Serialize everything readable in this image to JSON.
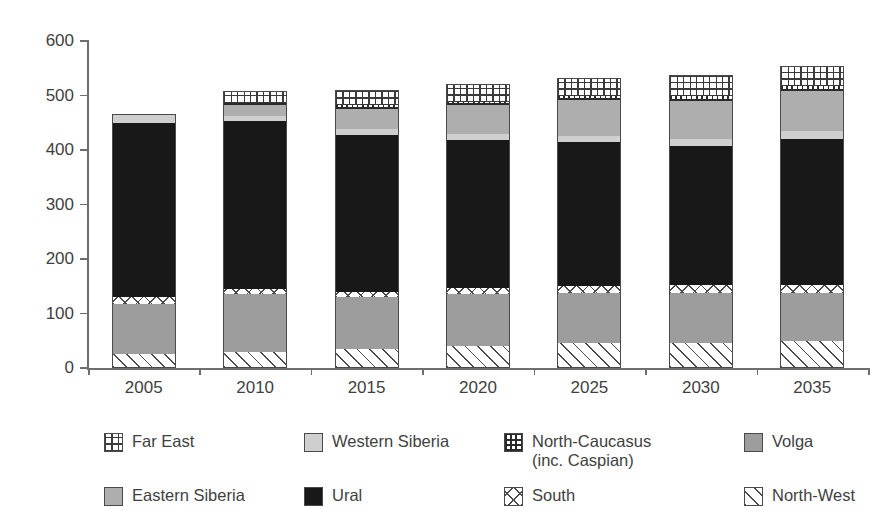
{
  "chart_data": {
    "type": "bar",
    "stacked": true,
    "title": "",
    "subtitle": "",
    "xlabel": "",
    "ylabel": "",
    "ylim": [
      0,
      600
    ],
    "ytick_values": [
      0,
      100,
      200,
      300,
      400,
      500,
      600
    ],
    "ytick_labels": [
      "0",
      "100",
      "200",
      "300",
      "400",
      "500",
      "600"
    ],
    "grid": false,
    "legend_position": "bottom",
    "categories": [
      "2005",
      "2010",
      "2015",
      "2020",
      "2025",
      "2030",
      "2035"
    ],
    "series": [
      {
        "name": "North-West",
        "key": "north-west",
        "pattern": "diagonal-hatch",
        "color": "#ffffff",
        "values": [
          25,
          30,
          35,
          40,
          45,
          46,
          50
        ]
      },
      {
        "name": "Volga",
        "key": "volga",
        "pattern": "solid",
        "color": "#9d9d9d",
        "values": [
          93,
          105,
          95,
          95,
          92,
          92,
          88
        ]
      },
      {
        "name": "South",
        "key": "south",
        "pattern": "cross-hatch",
        "color": "#ffffff",
        "values": [
          12,
          10,
          10,
          12,
          14,
          14,
          15
        ]
      },
      {
        "name": "Ural",
        "key": "ural",
        "pattern": "solid",
        "color": "#181818",
        "values": [
          320,
          308,
          288,
          272,
          263,
          256,
          268
        ]
      },
      {
        "name": "Western Siberia",
        "key": "western-siberia",
        "pattern": "solid",
        "color": "#cfcfcf",
        "values": [
          14,
          10,
          10,
          11,
          12,
          12,
          13
        ]
      },
      {
        "name": "Eastern Siberia",
        "key": "eastern-siberia",
        "pattern": "solid",
        "color": "#aeaeae",
        "values": [
          0,
          20,
          38,
          52,
          65,
          70,
          74
        ]
      },
      {
        "name": "North-Caucasus (inc. Caspian)",
        "key": "north-caucasus",
        "pattern": "grid-fine",
        "color": "#ffffff",
        "values": [
          0,
          4,
          6,
          7,
          8,
          9,
          9
        ]
      },
      {
        "name": "Far East",
        "key": "far-east",
        "pattern": "grid-coarse",
        "color": "#ffffff",
        "values": [
          3,
          22,
          28,
          32,
          34,
          38,
          38
        ]
      }
    ],
    "totals": [
      467,
      509,
      510,
      521,
      533,
      537,
      555
    ]
  },
  "legend": {
    "items": [
      {
        "label": "Far East",
        "key": "far-east",
        "row": 0,
        "col": 0
      },
      {
        "label": "Western Siberia",
        "key": "western-siberia",
        "row": 0,
        "col": 1
      },
      {
        "label": "North-Caucasus\n(inc. Caspian)",
        "key": "north-caucasus",
        "row": 0,
        "col": 2
      },
      {
        "label": "Volga",
        "key": "volga",
        "row": 0,
        "col": 3
      },
      {
        "label": "Eastern Siberia",
        "key": "eastern-siberia",
        "row": 1,
        "col": 0
      },
      {
        "label": "Ural",
        "key": "ural",
        "row": 1,
        "col": 1
      },
      {
        "label": "South",
        "key": "south",
        "row": 1,
        "col": 2
      },
      {
        "label": "North-West",
        "key": "north-west",
        "row": 1,
        "col": 3
      }
    ]
  },
  "colors": {
    "axis": "#6e6e6e",
    "text": "#3f3f3f",
    "outline": "#4a4a4a",
    "background": "#ffffff"
  }
}
